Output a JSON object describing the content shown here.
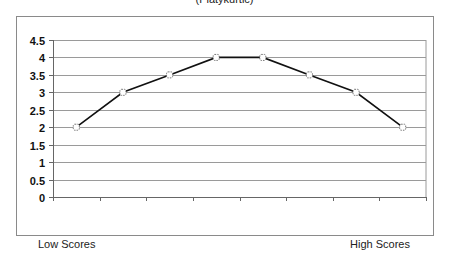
{
  "chart_data": {
    "type": "line",
    "title": "(Platykurtic)",
    "xlabel": "",
    "ylabel": "",
    "x_left_label": "Low Scores",
    "x_right_label": "High Scores",
    "categories": [
      "1",
      "2",
      "3",
      "4",
      "5",
      "6",
      "7",
      "8"
    ],
    "series": [
      {
        "name": "Distribution",
        "values": [
          2,
          3,
          3.5,
          4,
          4,
          3.5,
          3,
          2
        ]
      }
    ],
    "ylim": [
      0,
      4.5
    ],
    "yticks": [
      "0",
      "0.5",
      "1",
      "1.5",
      "2",
      "2.5",
      "3",
      "3.5",
      "4",
      "4.5"
    ],
    "grid": true,
    "legend": "none"
  },
  "colors": {
    "line": "#111111",
    "grid": "#9a9a9a",
    "marker_fill": "#ffffff"
  }
}
